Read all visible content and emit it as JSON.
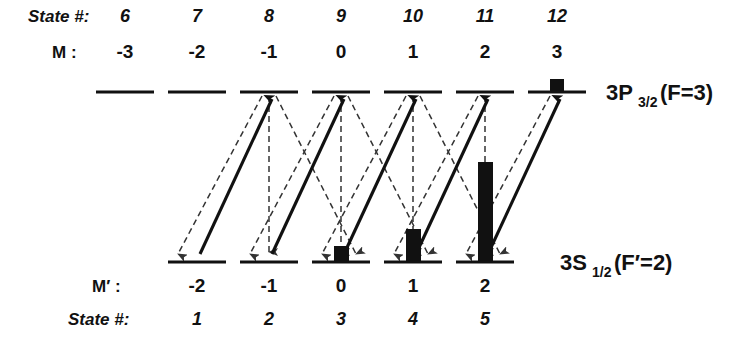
{
  "figure": {
    "type": "atomic-energy-level-diagram",
    "title_visible": false
  },
  "rows": {
    "top_state_label": "State #:",
    "top_m_label": "M :",
    "bottom_m_label": "M′ :",
    "bottom_state_label": "State #:"
  },
  "upper_manifold": {
    "term_symbol_main": "3P",
    "term_symbol_sub": "3/2",
    "term_symbol_tail": "(F=3)",
    "levels": [
      {
        "state": "6",
        "m": "-3",
        "x": 125,
        "has_population": false,
        "population_height": 0
      },
      {
        "state": "7",
        "m": "-2",
        "x": 197,
        "has_population": false,
        "population_height": 0
      },
      {
        "state": "8",
        "m": "-1",
        "x": 269,
        "has_population": false,
        "population_height": 0
      },
      {
        "state": "9",
        "m": "0",
        "x": 341,
        "has_population": false,
        "population_height": 0
      },
      {
        "state": "10",
        "m": "1",
        "x": 413,
        "has_population": false,
        "population_height": 0
      },
      {
        "state": "11",
        "m": "2",
        "x": 485,
        "has_population": false,
        "population_height": 0
      },
      {
        "state": "12",
        "m": "3",
        "x": 557,
        "has_population": true,
        "population_height": 13
      }
    ]
  },
  "lower_manifold": {
    "term_symbol_main": "3S",
    "term_symbol_sub": "1/2",
    "term_symbol_tail": "(F′=2)",
    "levels": [
      {
        "state": "1",
        "m": "-2",
        "x": 197,
        "has_population": false,
        "population_height": 0
      },
      {
        "state": "2",
        "m": "-1",
        "x": 269,
        "has_population": false,
        "population_height": 0
      },
      {
        "state": "3",
        "m": "0",
        "x": 341,
        "has_population": true,
        "population_height": 16
      },
      {
        "state": "4",
        "m": "1",
        "x": 413,
        "has_population": true,
        "population_height": 33
      },
      {
        "state": "5",
        "m": "2",
        "x": 485,
        "has_population": true,
        "population_height": 100
      }
    ]
  },
  "transitions": {
    "pump_label": "excitation",
    "decay_label": "spontaneous decay",
    "pump_arrows": [
      {
        "from_state": "1",
        "to_state": "8"
      },
      {
        "from_state": "2",
        "to_state": "9"
      },
      {
        "from_state": "3",
        "to_state": "10"
      },
      {
        "from_state": "4",
        "to_state": "11"
      },
      {
        "from_state": "5",
        "to_state": "12"
      }
    ],
    "decay_arrows": [
      {
        "from_state": "8",
        "to_state": "1"
      },
      {
        "from_state": "8",
        "to_state": "2"
      },
      {
        "from_state": "8",
        "to_state": "3"
      },
      {
        "from_state": "9",
        "to_state": "2"
      },
      {
        "from_state": "9",
        "to_state": "3"
      },
      {
        "from_state": "9",
        "to_state": "4"
      },
      {
        "from_state": "10",
        "to_state": "3"
      },
      {
        "from_state": "10",
        "to_state": "4"
      },
      {
        "from_state": "10",
        "to_state": "5"
      },
      {
        "from_state": "11",
        "to_state": "4"
      },
      {
        "from_state": "11",
        "to_state": "5"
      },
      {
        "from_state": "12",
        "to_state": "5"
      }
    ]
  },
  "geometry": {
    "upper_level_y": 92,
    "lower_level_y": 262,
    "level_half_width": 29,
    "state_row_y": 22,
    "m_row_y": 58,
    "m_prime_row_y": 292,
    "bottom_state_row_y": 325
  },
  "colors": {
    "ink": "#111111",
    "decay": "#333333",
    "background": "#ffffff"
  }
}
